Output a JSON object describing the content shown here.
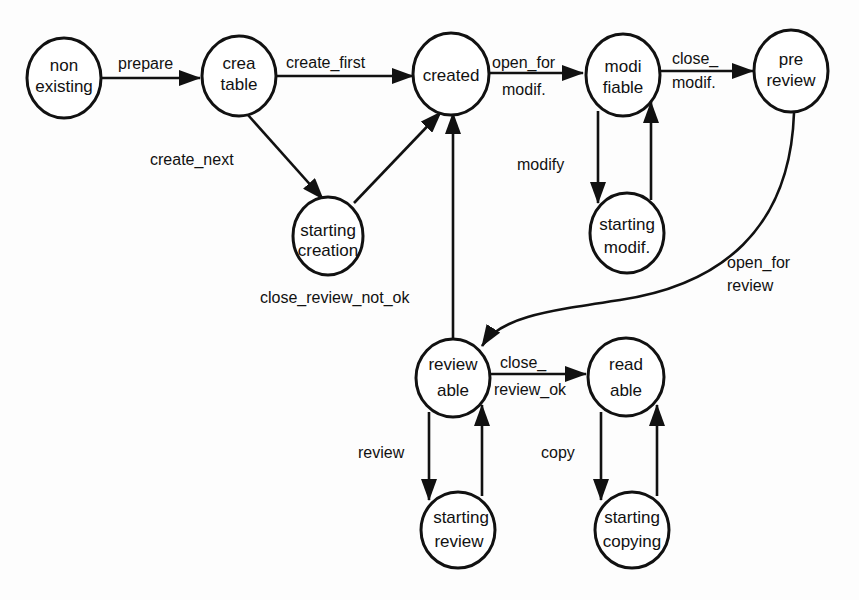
{
  "diagram": {
    "type": "state-transition",
    "nodes": [
      {
        "id": "non_existing",
        "lines": [
          "non",
          "existing"
        ]
      },
      {
        "id": "creatable",
        "lines": [
          "crea",
          "table"
        ]
      },
      {
        "id": "created",
        "lines": [
          "created"
        ]
      },
      {
        "id": "modifiable",
        "lines": [
          "modi",
          "fiable"
        ]
      },
      {
        "id": "pre_review",
        "lines": [
          "pre",
          "review"
        ]
      },
      {
        "id": "starting_creation",
        "lines": [
          "starting",
          "creation"
        ]
      },
      {
        "id": "starting_modif",
        "lines": [
          "starting",
          "modif."
        ]
      },
      {
        "id": "reviewable",
        "lines": [
          "review",
          "able"
        ]
      },
      {
        "id": "readable",
        "lines": [
          "read",
          "able"
        ]
      },
      {
        "id": "starting_review",
        "lines": [
          "starting",
          "review"
        ]
      },
      {
        "id": "starting_copying",
        "lines": [
          "starting",
          "copying"
        ]
      }
    ],
    "edges": [
      {
        "from": "non_existing",
        "to": "creatable",
        "lines": [
          "prepare"
        ]
      },
      {
        "from": "creatable",
        "to": "created",
        "lines": [
          "create_first"
        ]
      },
      {
        "from": "creatable",
        "to": "starting_creation",
        "lines": [
          "create_next"
        ]
      },
      {
        "from": "starting_creation",
        "to": "created",
        "lines": []
      },
      {
        "from": "created",
        "to": "modifiable",
        "lines": [
          "open_for",
          "modif."
        ]
      },
      {
        "from": "modifiable",
        "to": "pre_review",
        "lines": [
          "close_",
          "modif."
        ]
      },
      {
        "from": "modifiable",
        "to": "starting_modif",
        "lines": [
          "modify"
        ]
      },
      {
        "from": "starting_modif",
        "to": "modifiable",
        "lines": []
      },
      {
        "from": "pre_review",
        "to": "reviewable",
        "lines": [
          "open_for",
          "review"
        ]
      },
      {
        "from": "reviewable",
        "to": "created",
        "lines": [
          "close_review_not_ok"
        ]
      },
      {
        "from": "reviewable",
        "to": "readable",
        "lines": [
          "close_",
          "review_ok"
        ]
      },
      {
        "from": "reviewable",
        "to": "starting_review",
        "lines": [
          "review"
        ]
      },
      {
        "from": "starting_review",
        "to": "reviewable",
        "lines": []
      },
      {
        "from": "readable",
        "to": "starting_copying",
        "lines": [
          "copy"
        ]
      },
      {
        "from": "starting_copying",
        "to": "readable",
        "lines": []
      }
    ]
  },
  "nodes": {
    "non_existing": {
      "l1": "non",
      "l2": "existing"
    },
    "creatable": {
      "l1": "crea",
      "l2": "table"
    },
    "created": {
      "l1": "created"
    },
    "modifiable": {
      "l1": "modi",
      "l2": "fiable"
    },
    "pre_review": {
      "l1": "pre",
      "l2": "review"
    },
    "starting_creation": {
      "l1": "starting",
      "l2": "creation"
    },
    "starting_modif": {
      "l1": "starting",
      "l2": "modif."
    },
    "reviewable": {
      "l1": "review",
      "l2": "able"
    },
    "readable": {
      "l1": "read",
      "l2": "able"
    },
    "starting_review": {
      "l1": "starting",
      "l2": "review"
    },
    "starting_copying": {
      "l1": "starting",
      "l2": "copying"
    }
  },
  "edge_labels": {
    "prepare": "prepare",
    "create_first": "create_first",
    "create_next": "create_next",
    "open_for_modif_1": "open_for",
    "open_for_modif_2": "modif.",
    "close_modif_1": "close_",
    "close_modif_2": "modif.",
    "modify": "modify",
    "open_for_review_1": "open_for",
    "open_for_review_2": "review",
    "close_review_not_ok": "close_review_not_ok",
    "close_review_ok_1": "close_",
    "close_review_ok_2": "review_ok",
    "review": "review",
    "copy": "copy"
  }
}
